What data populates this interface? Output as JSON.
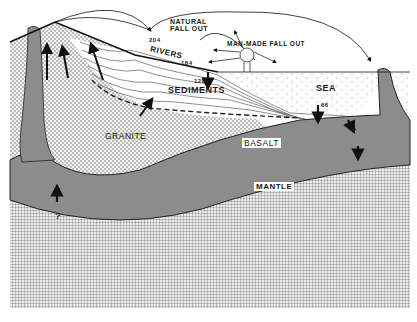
{
  "diagram": {
    "type": "geological cross-section",
    "labels": {
      "natural_fallout_line1": "NATURAL",
      "natural_fallout_line2": "FALL OUT",
      "man_made_fallout": "MAN-MADE FALL OUT",
      "rivers": "RIVERS",
      "sediments": "SEDIMENTS",
      "sea": "SEA",
      "granite": "GRANITE",
      "basalt": "BASALT",
      "mantle": "MANTLE"
    },
    "values": {
      "natural_fallout": "204",
      "rivers": "184",
      "sediments": "128",
      "sea_floor": "66"
    },
    "unknowns": {
      "mantle_flux": "?",
      "basalt_flux": "?",
      "ridge_flux": "?"
    },
    "layers": [
      {
        "name": "granite",
        "pattern": "dots",
        "color": "#f2f2f2"
      },
      {
        "name": "basalt",
        "pattern": "solid",
        "color": "#8a8a8a"
      },
      {
        "name": "mantle",
        "pattern": "grid",
        "color": "#e8e8e8"
      },
      {
        "name": "sediments",
        "pattern": "lines",
        "color": "#ffffff"
      },
      {
        "name": "sea",
        "pattern": "sparse-dots",
        "color": "#ffffff"
      }
    ]
  }
}
